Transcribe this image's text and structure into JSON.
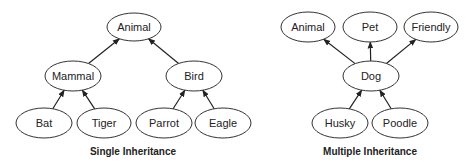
{
  "diagrams": [
    {
      "name": "single-inheritance",
      "caption": "Single Inheritance",
      "caption_pos": [
        133,
        146
      ],
      "nodes": [
        {
          "id": "animal",
          "label": "Animal",
          "cx": 134,
          "cy": 27,
          "rx": 27,
          "ry": 14
        },
        {
          "id": "mammal",
          "label": "Mammal",
          "cx": 73,
          "cy": 76,
          "rx": 28,
          "ry": 15
        },
        {
          "id": "bird",
          "label": "Bird",
          "cx": 194,
          "cy": 76,
          "rx": 28,
          "ry": 15
        },
        {
          "id": "bat",
          "label": "Bat",
          "cx": 44,
          "cy": 123,
          "rx": 28,
          "ry": 15
        },
        {
          "id": "tiger",
          "label": "Tiger",
          "cx": 104,
          "cy": 123,
          "rx": 27,
          "ry": 15
        },
        {
          "id": "parrot",
          "label": "Parrot",
          "cx": 164,
          "cy": 123,
          "rx": 28,
          "ry": 15
        },
        {
          "id": "eagle",
          "label": "Eagle",
          "cx": 223,
          "cy": 123,
          "rx": 28,
          "ry": 15
        }
      ],
      "edges": [
        {
          "from": "mammal",
          "to": "animal"
        },
        {
          "from": "bird",
          "to": "animal"
        },
        {
          "from": "bat",
          "to": "mammal"
        },
        {
          "from": "tiger",
          "to": "mammal"
        },
        {
          "from": "parrot",
          "to": "bird"
        },
        {
          "from": "eagle",
          "to": "bird"
        }
      ]
    },
    {
      "name": "multiple-inheritance",
      "caption": "Multiple Inheritance",
      "caption_pos": [
        370,
        146
      ],
      "nodes": [
        {
          "id": "animal2",
          "label": "Animal",
          "cx": 308,
          "cy": 27,
          "rx": 27,
          "ry": 15
        },
        {
          "id": "pet",
          "label": "Pet",
          "cx": 370,
          "cy": 27,
          "rx": 27,
          "ry": 15
        },
        {
          "id": "friendly",
          "label": "Friendly",
          "cx": 431,
          "cy": 27,
          "rx": 27,
          "ry": 15
        },
        {
          "id": "dog",
          "label": "Dog",
          "cx": 371,
          "cy": 76,
          "rx": 28,
          "ry": 15
        },
        {
          "id": "husky",
          "label": "Husky",
          "cx": 340,
          "cy": 123,
          "rx": 28,
          "ry": 15
        },
        {
          "id": "poodle",
          "label": "Poodle",
          "cx": 400,
          "cy": 123,
          "rx": 28,
          "ry": 15
        }
      ],
      "edges": [
        {
          "from": "dog",
          "to": "animal2"
        },
        {
          "from": "dog",
          "to": "pet"
        },
        {
          "from": "dog",
          "to": "friendly"
        },
        {
          "from": "husky",
          "to": "dog"
        },
        {
          "from": "poodle",
          "to": "dog"
        }
      ]
    }
  ],
  "colors": {
    "stroke": "#333333",
    "text": "#222222",
    "background": "#ffffff"
  }
}
